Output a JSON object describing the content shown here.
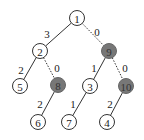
{
  "diagram": {
    "type": "tree",
    "colors": {
      "node_fill": "#ffffff",
      "shaded_fill": "#777777",
      "stroke": "#333333",
      "text": "#222222"
    },
    "nodes": [
      {
        "id": "1",
        "label": "1",
        "x": 77,
        "y": 18,
        "shaded": false
      },
      {
        "id": "2",
        "label": "2",
        "x": 40,
        "y": 51,
        "shaded": false
      },
      {
        "id": "9",
        "label": "9",
        "x": 109,
        "y": 51,
        "shaded": true
      },
      {
        "id": "5",
        "label": "5",
        "x": 20,
        "y": 86,
        "shaded": false
      },
      {
        "id": "8",
        "label": "8",
        "x": 58,
        "y": 85,
        "shaded": true
      },
      {
        "id": "3",
        "label": "3",
        "x": 90,
        "y": 86,
        "shaded": false
      },
      {
        "id": "10",
        "label": "10",
        "x": 126,
        "y": 86,
        "shaded": true
      },
      {
        "id": "6",
        "label": "6",
        "x": 38,
        "y": 122,
        "shaded": false
      },
      {
        "id": "7",
        "label": "7",
        "x": 69,
        "y": 122,
        "shaded": false
      },
      {
        "id": "4",
        "label": "4",
        "x": 107,
        "y": 122,
        "shaded": false
      }
    ],
    "edges": [
      {
        "from": "1",
        "to": "2",
        "label": "3",
        "style": "solid",
        "lx": 47,
        "ly": 34
      },
      {
        "from": "1",
        "to": "9",
        "label": "0",
        "style": "dotted",
        "lx": 97,
        "ly": 32
      },
      {
        "from": "2",
        "to": "5",
        "label": "2",
        "style": "solid",
        "lx": 21,
        "ly": 70
      },
      {
        "from": "2",
        "to": "8",
        "label": "0",
        "style": "dotted",
        "lx": 57,
        "ly": 68
      },
      {
        "from": "9",
        "to": "3",
        "label": "1",
        "style": "solid",
        "lx": 94,
        "ly": 68
      },
      {
        "from": "9",
        "to": "10",
        "label": "0",
        "style": "dotted",
        "lx": 125,
        "ly": 68
      },
      {
        "from": "8",
        "to": "6",
        "label": "2",
        "style": "solid",
        "lx": 40,
        "ly": 104
      },
      {
        "from": "3",
        "to": "7",
        "label": "1",
        "style": "solid",
        "lx": 73,
        "ly": 104
      },
      {
        "from": "10",
        "to": "4",
        "label": "2",
        "style": "solid",
        "lx": 110,
        "ly": 104
      }
    ]
  }
}
